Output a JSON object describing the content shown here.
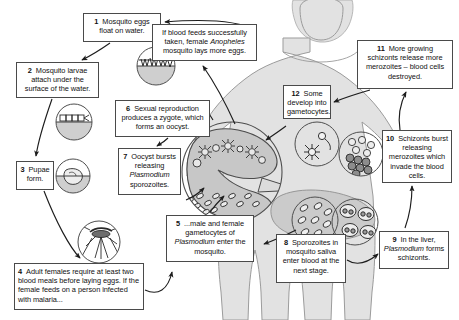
{
  "diagram": {
    "colors": {
      "box_border": "#4a4a4a",
      "box_fill": "#ffffff",
      "human_fill": "#e2e2e2",
      "human_stroke": "#8c8c8c",
      "organ_fill": "#c9c9c9",
      "water_fill": "#d6d6d6",
      "line": "#222222",
      "text": "#111111"
    }
  },
  "boxes": {
    "box1": {
      "num": "1",
      "text": "Mosquito eggs float on water."
    },
    "box2": {
      "num": "2",
      "text": "Mosquito larvae attach under the surface of the water."
    },
    "box3": {
      "num": "3",
      "text": "Pupae form."
    },
    "box4": {
      "num": "4",
      "text": "Adult females require at least two blood meals before laying eggs.  If the female feeds on a person infected with malaria..."
    },
    "box5": {
      "num": "5",
      "pre": "...male and female gametocytes of ",
      "italic": "Plasmodium",
      "post": " enter the mosquito."
    },
    "box6": {
      "num": "6",
      "text": "Sexual reproduction produces a zygote, which forms an oocyst."
    },
    "box7": {
      "num": "7",
      "pre": "Oocyst bursts releasing ",
      "italic": "Plasmodium",
      "post": " sporozoites."
    },
    "box8": {
      "num": "8",
      "text": "Sporozoites in mosquito saliva enter blood at the next stage."
    },
    "box9": {
      "num": "9",
      "pre": "In the liver, ",
      "italic": "Plasmodium",
      "post": " forms schizonts."
    },
    "box10": {
      "num": "10",
      "text": "Schizonts burst releasing merozoites which invade the blood cells."
    },
    "box11": {
      "num": "11",
      "text": "More growing schizonts release more merozoites – blood cells destroyed."
    },
    "box12": {
      "num": "12",
      "text": "Some develop into gametocytes."
    },
    "boxBlood": {
      "pre": "If blood feeds successfully taken, female ",
      "italic": "Anopheles",
      "post": " mosquito lays more eggs."
    }
  },
  "illustrations": {
    "eggs_circle": "mosquito-eggs-on-water",
    "larvae_circle": "mosquito-larvae-under-water-surface",
    "pupae_circle": "mosquito-pupa",
    "adult_circle": "adult-female-mosquito",
    "gut_circle": "mosquito-gut-with-oocysts-and-sporozoites",
    "gametocyte_circle": "gametocytes-in-blood",
    "merozoite_circle": "merozoites-invading-blood-cells",
    "sporozoite_circle": "sporozoites-in-mosquito-saliva",
    "schizont_circle": "liver-cells-with-schizonts",
    "human_figure": "human-body-silhouette"
  }
}
